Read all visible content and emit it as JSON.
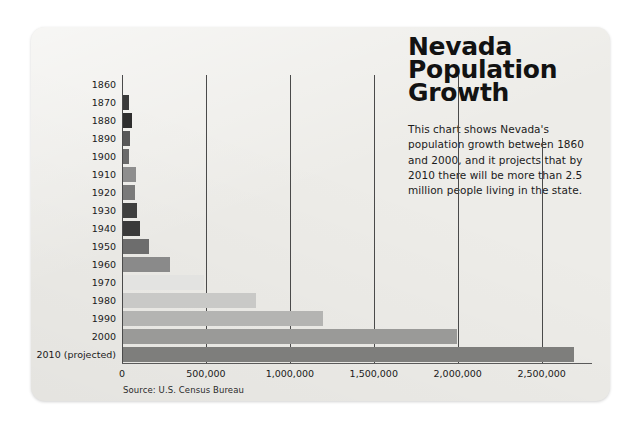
{
  "card": {
    "title_lines": [
      "Nevada",
      "Population",
      "Growth"
    ],
    "description": "This chart shows Nevada's population growth between 1860 and 2000, and it projects that by 2010 there will be more than 2.5 million people living in the state.",
    "source": "Source: U.S. Census Bureau"
  },
  "chart_data": {
    "type": "bar",
    "orientation": "horizontal",
    "title": "Nevada Population Growth",
    "xlabel": "",
    "ylabel": "",
    "xlim": [
      0,
      2800000
    ],
    "grid": true,
    "legend": "none",
    "xticks": [
      0,
      500000,
      1000000,
      1500000,
      2000000,
      2500000
    ],
    "xtick_labels": [
      "0",
      "500,000",
      "1,000,000",
      "1,500,000",
      "2,000,000",
      "2,500,000"
    ],
    "categories": [
      "1860",
      "1870",
      "1880",
      "1890",
      "1900",
      "1910",
      "1920",
      "1930",
      "1940",
      "1950",
      "1960",
      "1970",
      "1980",
      "1990",
      "2000",
      "2010 (projected)"
    ],
    "values": [
      7000,
      42000,
      62000,
      47000,
      42000,
      82000,
      77000,
      91000,
      110000,
      160000,
      285000,
      489000,
      800000,
      1200000,
      1998000,
      2690000
    ],
    "bar_colors": [
      "#4f4f4f",
      "#3a3a3a",
      "#2e2e2e",
      "#585858",
      "#6b6b6b",
      "#8e8e8e",
      "#7a7a7a",
      "#3f3f3f",
      "#3a3a3a",
      "#6d6d6d",
      "#8a8a8a",
      "#e3e3e1",
      "#c9c9c7",
      "#b4b4b2",
      "#9a9a98",
      "#7e7e7c"
    ]
  }
}
